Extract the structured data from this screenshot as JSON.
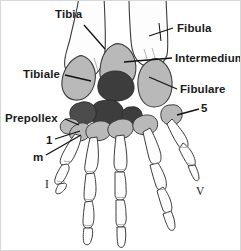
{
  "figure": {
    "name": "amphibian-manus-skeleton-diagram",
    "caption_labels": {
      "tibia": "Tibia",
      "fibula": "Fibula",
      "intermedium": "Intermedium",
      "tibiale": "Tibiale",
      "fibulare": "Fibulare",
      "five": "5",
      "prepollex": "Prepollex",
      "one": "1",
      "m": "m",
      "digit_i": "I",
      "digit_v": "V"
    },
    "colors": {
      "background": "#ffffff",
      "outline": "#3c3c3c",
      "bone_white": "#fdfdfd",
      "bone_light_gray": "#b9b9b9",
      "bone_mid_gray": "#9d9d9d",
      "bone_dark_gray": "#3d3d3d",
      "label_text": "#1a1a1a",
      "leader_line": "#111111",
      "border": "#d8d8d8"
    },
    "structures": [
      {
        "id": "tibia",
        "label": "Tibia",
        "fill": "bone_white",
        "region": "proximal-left"
      },
      {
        "id": "fibula",
        "label": "Fibula",
        "fill": "bone_white",
        "region": "proximal-right"
      },
      {
        "id": "intermedium",
        "label": "Intermedium",
        "fill": "bone_light_gray",
        "region": "carpal-center-proximal"
      },
      {
        "id": "tibiale",
        "label": "Tibiale",
        "fill": "bone_light_gray",
        "region": "carpal-left"
      },
      {
        "id": "fibulare",
        "label": "Fibulare",
        "fill": "bone_light_gray",
        "region": "carpal-right"
      },
      {
        "id": "centrale-1",
        "label": "",
        "fill": "bone_dark_gray",
        "region": "carpal-center"
      },
      {
        "id": "centrale-2",
        "label": "",
        "fill": "bone_dark_gray",
        "region": "carpal-center"
      },
      {
        "id": "centrale-3",
        "label": "",
        "fill": "bone_dark_gray",
        "region": "carpal-center"
      },
      {
        "id": "centrale-4",
        "label": "",
        "fill": "bone_dark_gray",
        "region": "carpal-center"
      },
      {
        "id": "distal-5",
        "label": "5",
        "fill": "bone_light_gray",
        "region": "distal-carpal-lateral"
      },
      {
        "id": "prepollex",
        "label": "Prepollex",
        "fill": "bone_light_gray",
        "region": "medial-margin"
      },
      {
        "id": "distal-1",
        "label": "1",
        "fill": "bone_light_gray",
        "region": "distal-carpal-medial"
      },
      {
        "id": "metacarpal",
        "label": "m",
        "fill": "bone_white",
        "region": "metacarpal-i"
      },
      {
        "id": "digit-i",
        "label": "I",
        "fill": "bone_white",
        "region": "digit-medial"
      },
      {
        "id": "digit-v",
        "label": "V",
        "fill": "bone_white",
        "region": "digit-lateral"
      }
    ],
    "digit_count": 5
  }
}
